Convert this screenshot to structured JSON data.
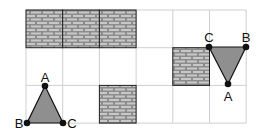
{
  "grid": {
    "cols": 6,
    "rows": 3,
    "x0": 26,
    "y0": 10,
    "cell_w": 36.7,
    "cell_h": 37.7,
    "line_color": "#cfcfcf"
  },
  "brick_cells": [
    {
      "col": 0,
      "row": 0
    },
    {
      "col": 1,
      "row": 0
    },
    {
      "col": 2,
      "row": 0
    },
    {
      "col": 4,
      "row": 1
    },
    {
      "col": 2,
      "row": 2
    }
  ],
  "colors": {
    "brick_fill": "#8c8c8c",
    "mortar": "#d0d0d0",
    "triangle_fill": "#8f8f8f",
    "stroke": "#111111"
  },
  "triangles": [
    {
      "name": "triangle-left",
      "vertices": [
        {
          "label": "A",
          "x": 45,
          "y": 86,
          "lx": 45,
          "ly": 82,
          "anchor": "middle"
        },
        {
          "label": "B",
          "x": 27,
          "y": 123,
          "lx": 19,
          "ly": 128,
          "anchor": "middle"
        },
        {
          "label": "C",
          "x": 63,
          "y": 123,
          "lx": 72,
          "ly": 128,
          "anchor": "middle"
        }
      ]
    },
    {
      "name": "triangle-right",
      "vertices": [
        {
          "label": "C",
          "x": 209,
          "y": 47,
          "lx": 209,
          "ly": 42,
          "anchor": "middle"
        },
        {
          "label": "B",
          "x": 246,
          "y": 47,
          "lx": 246,
          "ly": 42,
          "anchor": "middle"
        },
        {
          "label": "A",
          "x": 228,
          "y": 84,
          "lx": 228,
          "ly": 101,
          "anchor": "middle"
        }
      ]
    }
  ]
}
